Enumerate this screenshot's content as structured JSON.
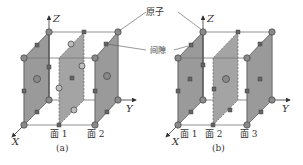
{
  "figure": {
    "annotations": {
      "atom_label": "原子",
      "interstice_label": "间隙"
    },
    "panel_a": {
      "caption": "(a)",
      "axes": {
        "x": "X",
        "y": "Y",
        "z": "Z"
      },
      "plane_labels": [
        "面 1",
        "面 2"
      ]
    },
    "panel_b": {
      "caption": "(b)",
      "axes": {
        "x": "X",
        "y": "Y",
        "z": "Z"
      },
      "plane_labels": [
        "面 1",
        "面 2",
        "面 3"
      ]
    },
    "colors": {
      "plane_fill": "#9a9a9a",
      "atom_fill": "#8a8a8a",
      "edge": "#777777"
    }
  }
}
